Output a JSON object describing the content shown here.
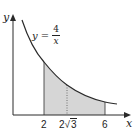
{
  "axes": {
    "x_label": "x",
    "y_label": "y"
  },
  "curve": {
    "equation_lhs": "y =",
    "numerator": "4",
    "denominator": "x"
  },
  "ticks": {
    "a": "2",
    "mid_coef": "2",
    "mid_rad": "3",
    "b": "6"
  },
  "colors": {
    "curve": "#2a2a2a",
    "axis": "#2a2a2a",
    "shade": "#d4d4d4"
  }
}
